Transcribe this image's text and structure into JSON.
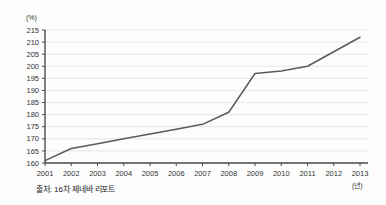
{
  "figure": {
    "background_color": "#fdfdfd",
    "axis_color": "#4a4a4a",
    "grid_color": "#e2e2e2",
    "line_color": "#5a5a5a",
    "source_note": "출처: 16차 제네바 리포트",
    "y_unit_label": "(%)",
    "x_unit_label": "(년)"
  },
  "chart_data": {
    "type": "line",
    "title": "",
    "subtitle": "",
    "xlabel": "(년)",
    "ylabel": "(%)",
    "categories": [
      "2001",
      "2002",
      "2003",
      "2004",
      "2005",
      "2006",
      "2007",
      "2008",
      "2009",
      "2010",
      "2011",
      "2012",
      "2013"
    ],
    "x": [
      2001,
      2002,
      2003,
      2004,
      2005,
      2006,
      2007,
      2008,
      2009,
      2010,
      2011,
      2012,
      2013
    ],
    "values": [
      161,
      166,
      168,
      170,
      172,
      174,
      176,
      181,
      197,
      198,
      200,
      206,
      212
    ],
    "series": [
      {
        "name": "세계 부채 비율",
        "values": [
          161,
          166,
          168,
          170,
          172,
          174,
          176,
          181,
          197,
          198,
          200,
          206,
          212
        ]
      }
    ],
    "ylim": [
      160,
      215
    ],
    "yticks": [
      160,
      165,
      170,
      175,
      180,
      185,
      190,
      195,
      200,
      205,
      210,
      215
    ],
    "ytick_labels": [
      "160",
      "165",
      "170",
      "175",
      "180",
      "185",
      "190",
      "195",
      "200",
      "205",
      "210",
      "215"
    ],
    "xtick_labels": [
      "2001",
      "2002",
      "2003",
      "2004",
      "2005",
      "2006",
      "2007",
      "2008",
      "2009",
      "2010",
      "2011",
      "2012",
      "2013"
    ],
    "grid": true,
    "grid_axis": "y",
    "legend": false,
    "legend_position": "none",
    "annotations": []
  }
}
